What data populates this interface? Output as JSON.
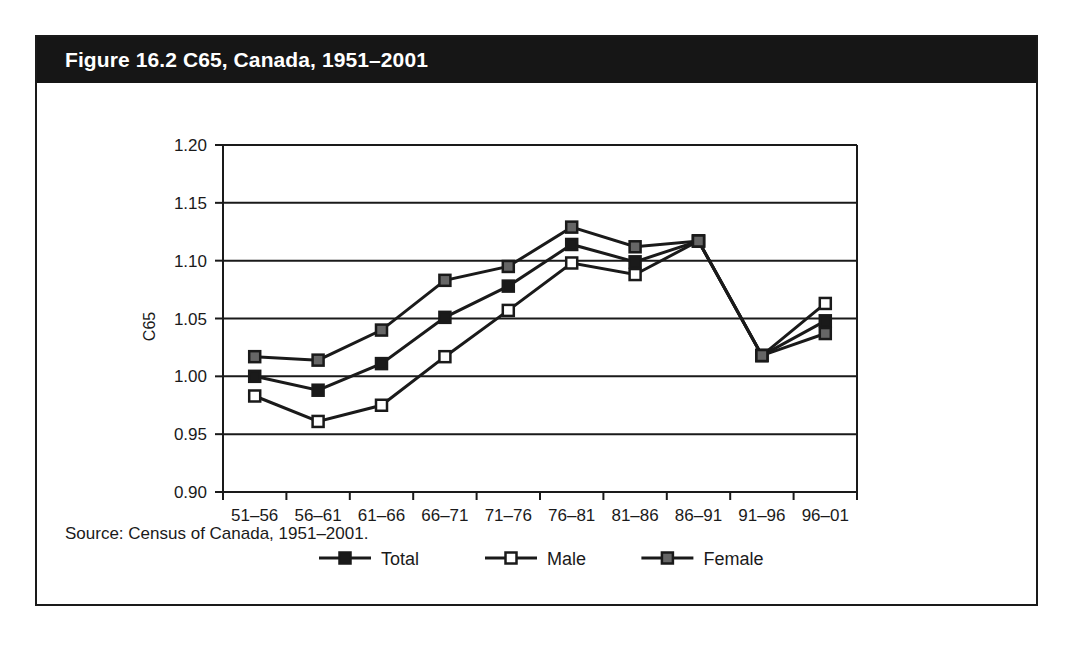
{
  "figure": {
    "title": "Figure 16.2 C65, Canada, 1951–2001",
    "source": "Source: Census of Canada, 1951–2001."
  },
  "colors": {
    "banner_background": "#161616",
    "frame": "#1a1a1a",
    "total_marker": "#1a1a1a",
    "male_marker": "#ffffff",
    "female_marker": "#666666",
    "line": "#1a1a1a",
    "gridline": "#1a1a1a",
    "page_background": "#ffffff"
  },
  "chart_data": {
    "type": "line",
    "title": "Figure 16.2 C65, Canada, 1951–2001",
    "xlabel": "",
    "ylabel": "C65",
    "ylim": [
      0.9,
      1.2
    ],
    "ytick_labels": [
      "1.20",
      "1.15",
      "1.10",
      "1.05",
      "1.00",
      "0.95",
      "0.90"
    ],
    "ytick_values": [
      1.2,
      1.15,
      1.1,
      1.05,
      1.0,
      0.95,
      0.9
    ],
    "grid": true,
    "legend_position": "bottom",
    "categories": [
      "51–56",
      "56–61",
      "61–66",
      "66–71",
      "71–76",
      "76–81",
      "81–86",
      "86–91",
      "91–96",
      "96–01"
    ],
    "series": [
      {
        "name": "Total",
        "marker": "filled-square",
        "values": [
          1.0,
          0.988,
          1.011,
          1.051,
          1.078,
          1.114,
          1.099,
          1.117,
          1.018,
          1.048
        ]
      },
      {
        "name": "Male",
        "marker": "open-square",
        "values": [
          0.983,
          0.961,
          0.975,
          1.017,
          1.057,
          1.098,
          1.088,
          1.117,
          1.018,
          1.063
        ]
      },
      {
        "name": "Female",
        "marker": "gray-square",
        "values": [
          1.017,
          1.014,
          1.04,
          1.083,
          1.095,
          1.129,
          1.112,
          1.117,
          1.018,
          1.037
        ]
      }
    ]
  }
}
